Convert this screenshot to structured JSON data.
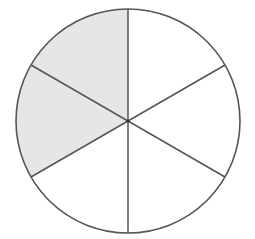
{
  "diagram": {
    "type": "fraction-circle",
    "total_parts": 6,
    "shaded_parts": 2,
    "fraction_label": "2/6",
    "center": [
      128,
      121
    ],
    "radius": 112,
    "shaded_sectors": [
      {
        "name": "upper-left",
        "start_angle_deg": -90,
        "end_angle_deg": -150
      },
      {
        "name": "left",
        "start_angle_deg": -150,
        "end_angle_deg": -210
      }
    ],
    "divider_angles_deg": [
      -90,
      -30,
      30,
      90,
      150,
      210
    ],
    "colors": {
      "shade": "#e6e6e6",
      "stroke": "#555555",
      "background": "#ffffff",
      "unshaded": "#ffffff"
    }
  }
}
